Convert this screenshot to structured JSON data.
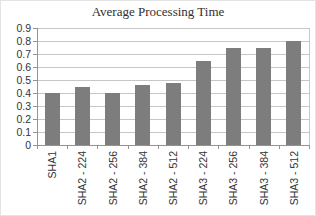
{
  "chart_data": {
    "type": "bar",
    "title": "Average Processing Time",
    "categories": [
      "SHA1",
      "SHA2 - 224",
      "SHA2 - 256",
      "SHA2 - 384",
      "SHA2 - 512",
      "SHA3 - 224",
      "SHA3 - 256",
      "SHA3 - 384",
      "SHA3 - 512"
    ],
    "values": [
      0.4,
      0.45,
      0.4,
      0.46,
      0.48,
      0.65,
      0.75,
      0.75,
      0.8
    ],
    "xlabel": "",
    "ylabel": "",
    "ylim": [
      0,
      0.9
    ],
    "ytick_step": 0.1,
    "yticks": [
      "0",
      "0.1",
      "0.2",
      "0.3",
      "0.4",
      "0.5",
      "0.6",
      "0.7",
      "0.8",
      "0.9"
    ],
    "grid": "horizontal",
    "legend": "none",
    "colors": {
      "bar": "#7d7d7d",
      "gridline": "#c6c6c6",
      "axis": "#939393",
      "plot_right_border": "#c6c6c6",
      "text": "#333333",
      "title_text": "#303030",
      "background": "#ffffff"
    }
  }
}
